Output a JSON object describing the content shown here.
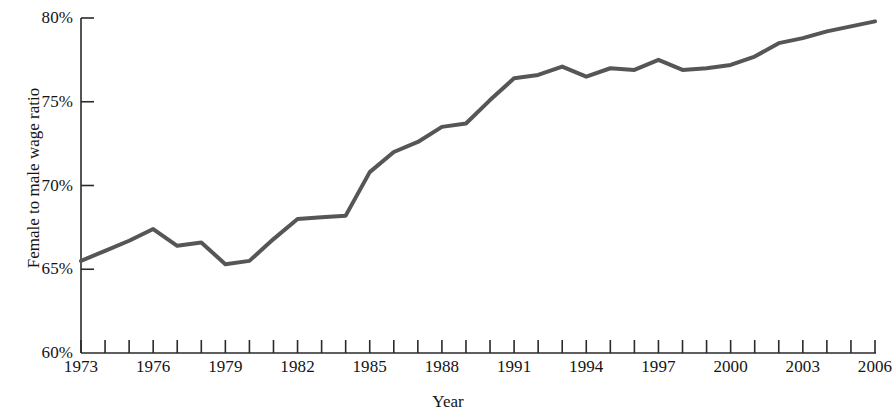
{
  "chart_data": {
    "type": "line",
    "title": "",
    "xlabel": "Year",
    "ylabel": "Female to male wage ratio",
    "xlim": [
      1973,
      2006
    ],
    "ylim": [
      60,
      80
    ],
    "y_tick_step": 5,
    "x_tick_step": 1,
    "x_label_step": 3,
    "grid": false,
    "legend": "none",
    "y_tick_labels": [
      "60%",
      "65%",
      "70%",
      "75%",
      "80%"
    ],
    "y_ticks": [
      60,
      65,
      70,
      75,
      80
    ],
    "x_tick_labels": [
      "1973",
      "1976",
      "1979",
      "1982",
      "1985",
      "1988",
      "1991",
      "1994",
      "1997",
      "2000",
      "2003",
      "2006"
    ],
    "x_ticks": [
      1973,
      1974,
      1975,
      1976,
      1977,
      1978,
      1979,
      1980,
      1981,
      1982,
      1983,
      1984,
      1985,
      1986,
      1987,
      1988,
      1989,
      1990,
      1991,
      1992,
      1993,
      1994,
      1995,
      1996,
      1997,
      1998,
      1999,
      2000,
      2001,
      2002,
      2003,
      2004,
      2005,
      2006
    ],
    "series": [
      {
        "name": "Female to male wage ratio",
        "color": "#565656",
        "line_width": 4,
        "x": [
          1973,
          1974,
          1975,
          1976,
          1977,
          1978,
          1979,
          1980,
          1981,
          1982,
          1983,
          1984,
          1985,
          1986,
          1987,
          1988,
          1989,
          1990,
          1991,
          1992,
          1993,
          1994,
          1995,
          1996,
          1997,
          1998,
          1999,
          2000,
          2001,
          2002,
          2003,
          2004,
          2005,
          2006
        ],
        "values": [
          65.5,
          66.1,
          66.7,
          67.4,
          66.4,
          66.6,
          65.3,
          65.5,
          66.8,
          68.0,
          68.1,
          68.2,
          70.8,
          72.0,
          72.6,
          73.5,
          73.7,
          75.1,
          76.4,
          76.6,
          77.1,
          76.5,
          77.0,
          76.9,
          77.5,
          76.9,
          77.0,
          77.2,
          77.7,
          78.5,
          78.8,
          79.2,
          79.5,
          79.8
        ]
      }
    ]
  },
  "axes": {
    "y_axis_name": "y-axis",
    "x_axis_name": "x-axis"
  }
}
